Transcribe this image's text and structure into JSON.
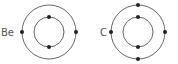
{
  "diagram": {
    "type": "electron-shell",
    "atoms": [
      {
        "symbol": "Be",
        "shells": [
          2,
          2
        ]
      },
      {
        "symbol": "C",
        "shells": [
          2,
          4
        ]
      }
    ],
    "colors": {
      "line": "#555555",
      "electron": "#222222",
      "label": "#555555"
    }
  }
}
